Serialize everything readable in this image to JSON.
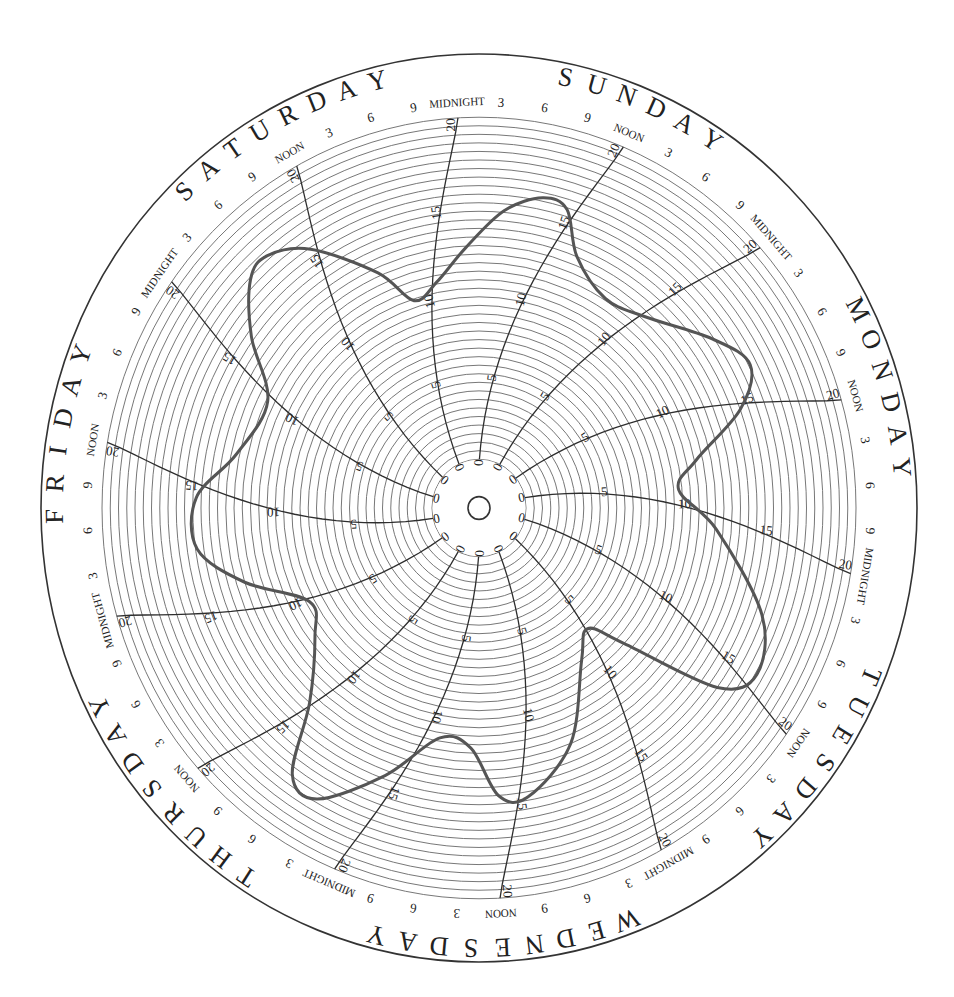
{
  "chart_data": {
    "type": "line",
    "subtype": "polar-circular-chart-recorder",
    "title": "",
    "direction": "clockwise",
    "days": [
      "SUNDAY",
      "MONDAY",
      "TUESDAY",
      "WEDNESDAY",
      "THURSDAY",
      "FRIDAY",
      "SATURDAY"
    ],
    "time_labels": [
      "MIDNIGHT",
      "3",
      "6",
      "9",
      "NOON",
      "3",
      "6",
      "9"
    ],
    "radial_axis": {
      "min": 0,
      "max": 20,
      "ticks": [
        0,
        5,
        10,
        15,
        20
      ],
      "minor_step": 0.5
    },
    "grid": true,
    "series": [
      {
        "name": "recorded value",
        "unit_angle": "degrees clockwise from top (Sunday midnight ≈ -3)",
        "points": [
          {
            "angle": -3,
            "day": "Sunday",
            "time": "00:00",
            "value": 12.4
          },
          {
            "angle": 5,
            "day": "Sunday",
            "time": "~08:00",
            "value": 14.6
          },
          {
            "angle": 12,
            "day": "Sunday",
            "time": "~14:00",
            "value": 15.7
          },
          {
            "angle": 17,
            "day": "Sunday",
            "time": "~19:00",
            "value": 15.4
          },
          {
            "angle": 22,
            "day": "Sunday",
            "time": "~23:00",
            "value": 13.0
          },
          {
            "angle": 32,
            "day": "Monday",
            "time": "~08:00",
            "value": 11.6
          },
          {
            "angle": 42,
            "day": "Monday",
            "time": "~17:00",
            "value": 12.2
          },
          {
            "angle": 55,
            "day": "Tuesday",
            "time": "~04:00",
            "value": 14.4
          },
          {
            "angle": 63,
            "day": "Tuesday",
            "time": "~11:00",
            "value": 15.6
          },
          {
            "angle": 70,
            "day": "Tuesday",
            "time": "~18:00",
            "value": 14.0
          },
          {
            "angle": 78,
            "day": "Wednesday",
            "time": "~01:00",
            "value": 10.6
          },
          {
            "angle": 85,
            "day": "Wednesday",
            "time": "~07:00",
            "value": 9.3
          },
          {
            "angle": 95,
            "day": "Wednesday",
            "time": "~16:00",
            "value": 11.6
          },
          {
            "angle": 110,
            "day": "Thursday",
            "time": "~06:00",
            "value": 15.4
          },
          {
            "angle": 120,
            "day": "Thursday",
            "time": "~15:00",
            "value": 16.6
          },
          {
            "angle": 126,
            "day": "Thursday",
            "time": "~20:00",
            "value": 15.0
          },
          {
            "angle": 132,
            "day": "Friday",
            "time": "~01:00",
            "value": 9.0
          },
          {
            "angle": 137,
            "day": "Friday",
            "time": "~05:00",
            "value": 6.8
          },
          {
            "angle": 145,
            "day": "Friday",
            "time": "~12:00",
            "value": 8.0
          },
          {
            "angle": 158,
            "day": "Saturday",
            "time": "~00:00",
            "value": 12.0
          },
          {
            "angle": 170,
            "day": "Saturday",
            "time": "~11:00",
            "value": 14.3
          },
          {
            "angle": 176,
            "day": "Saturday",
            "time": "~16:00",
            "value": 14.0
          },
          {
            "angle": 182,
            "day": "Saturday",
            "time": "~22:00",
            "value": 11.2
          },
          {
            "angle": 190,
            "day": "Sunday",
            "time": "~05:00",
            "value": 10.8
          },
          {
            "angle": 200,
            "day": "Sunday",
            "time": "~14:00",
            "value": 13.8
          },
          {
            "angle": 210,
            "day": "Sunday",
            "time": "~23:00",
            "value": 16.8
          },
          {
            "angle": 216,
            "day": "Monday",
            "time": "~04:00",
            "value": 16.4
          },
          {
            "angle": 222,
            "day": "Monday",
            "time": "~10:00",
            "value": 12.5
          },
          {
            "angle": 233,
            "day": "Monday",
            "time": "~20:00",
            "value": 9.6
          },
          {
            "angle": 242,
            "day": "Tuesday",
            "time": "~04:00",
            "value": 8.8
          },
          {
            "angle": 253,
            "day": "Tuesday",
            "time": "~14:00",
            "value": 12.0
          },
          {
            "angle": 262,
            "day": "Tuesday",
            "time": "~22:00",
            "value": 14.4
          },
          {
            "angle": 272,
            "day": "Wednesday",
            "time": "~07:00",
            "value": 14.3
          },
          {
            "angle": 282,
            "day": "Wednesday",
            "time": "~16:00",
            "value": 12.2
          },
          {
            "angle": 296,
            "day": "Thursday",
            "time": "~05:00",
            "value": 11.4
          },
          {
            "angle": 306,
            "day": "Thursday",
            "time": "~14:00",
            "value": 14.2
          },
          {
            "angle": 314,
            "day": "Thursday",
            "time": "~21:00",
            "value": 16.4
          },
          {
            "angle": 319,
            "day": "Friday",
            "time": "~02:00",
            "value": 16.7
          },
          {
            "angle": 326,
            "day": "Friday",
            "time": "~08:00",
            "value": 15.4
          },
          {
            "angle": 336,
            "day": "Friday",
            "time": "~17:00",
            "value": 12.2
          },
          {
            "angle": 342,
            "day": "Friday",
            "time": "~22:00",
            "value": 9.9
          },
          {
            "angle": 349,
            "day": "Saturday",
            "time": "~04:00",
            "value": 10.6
          }
        ]
      }
    ],
    "xlabel": "",
    "ylabel": ""
  },
  "layout": {
    "cx": 479,
    "cy": 508,
    "outer_rx": 438,
    "outer_ry": 454,
    "grid_inner_r": 47,
    "grid_outer_r": 377,
    "hub_r": 11,
    "time_label_r": 392,
    "day_label_r": 425,
    "start_angle": -3.2,
    "colors": {
      "background": "#ffffff",
      "outer_ring": "#333333",
      "grid_ring": "#6a6a6a",
      "radial_line": "#2e2e2e",
      "curve": "#555555",
      "text": "#222222"
    }
  }
}
